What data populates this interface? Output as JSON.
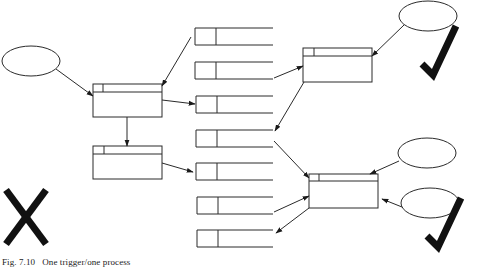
{
  "figure": {
    "caption": "Fig. 7.10   One trigger/one process",
    "colors": {
      "line": "#2a2a2a",
      "mark": "#111111",
      "background": "#ffffff"
    }
  },
  "diagram": {
    "triggers": [
      {
        "id": "trigger-left",
        "cx": 31,
        "cy": 61,
        "rx": 29,
        "ry": 15
      },
      {
        "id": "trigger-top-right",
        "cx": 428,
        "cy": 16,
        "rx": 29,
        "ry": 15
      },
      {
        "id": "trigger-right-upper",
        "cx": 427,
        "cy": 153,
        "rx": 29,
        "ry": 15
      },
      {
        "id": "trigger-right-lower",
        "cx": 430,
        "cy": 203,
        "rx": 29,
        "ry": 15
      }
    ],
    "processes": [
      {
        "id": "process-a",
        "x": 93,
        "y": 84,
        "w": 69,
        "h": 33,
        "header": 8,
        "tab": 10
      },
      {
        "id": "process-b",
        "x": 93,
        "y": 146,
        "w": 69,
        "h": 33,
        "header": 8,
        "tab": 11
      },
      {
        "id": "process-c",
        "x": 303,
        "y": 48,
        "w": 69,
        "h": 34,
        "header": 8,
        "tab": 11
      },
      {
        "id": "process-d",
        "x": 309,
        "y": 174,
        "w": 69,
        "h": 34,
        "header": 7,
        "tab": 10
      }
    ],
    "data_stores": [
      {
        "id": "store-1",
        "x": 195,
        "y": 28,
        "w": 78,
        "h": 17,
        "tab": 21
      },
      {
        "id": "store-2",
        "x": 195,
        "y": 62,
        "w": 78,
        "h": 17,
        "tab": 21
      },
      {
        "id": "store-3",
        "x": 196,
        "y": 96,
        "w": 77,
        "h": 17,
        "tab": 21
      },
      {
        "id": "store-4",
        "x": 196,
        "y": 130,
        "w": 77,
        "h": 17,
        "tab": 21
      },
      {
        "id": "store-5",
        "x": 196,
        "y": 163,
        "w": 77,
        "h": 17,
        "tab": 21
      },
      {
        "id": "store-6",
        "x": 197,
        "y": 197,
        "w": 76,
        "h": 17,
        "tab": 21
      },
      {
        "id": "store-7",
        "x": 197,
        "y": 230,
        "w": 76,
        "h": 17,
        "tab": 21
      }
    ],
    "arrows": [
      {
        "id": "trigger-left-to-process-a",
        "x1": 56,
        "y1": 69,
        "x2": 93,
        "y2": 96
      },
      {
        "id": "store-1-to-process-a",
        "x1": 191,
        "y1": 37,
        "x2": 162,
        "y2": 86
      },
      {
        "id": "process-a-to-store-3",
        "x1": 162,
        "y1": 100,
        "x2": 195,
        "y2": 104
      },
      {
        "id": "process-a-to-process-b",
        "x1": 127,
        "y1": 117,
        "x2": 127,
        "y2": 146
      },
      {
        "id": "process-b-to-store-5",
        "x1": 162,
        "y1": 163,
        "x2": 193,
        "y2": 172
      },
      {
        "id": "store-3-to-process-c",
        "x1": 274,
        "y1": 78,
        "x2": 303,
        "y2": 66
      },
      {
        "id": "trigger-top-right-to-process-c",
        "x1": 404,
        "y1": 25,
        "x2": 372,
        "y2": 56
      },
      {
        "id": "process-c-to-store-4",
        "x1": 304,
        "y1": 82,
        "x2": 275,
        "y2": 131
      },
      {
        "id": "store-4-to-process-d",
        "x1": 274,
        "y1": 141,
        "x2": 309,
        "y2": 178
      },
      {
        "id": "trigger-right-upper-to-process-d",
        "x1": 399,
        "y1": 161,
        "x2": 370,
        "y2": 174
      },
      {
        "id": "store-6-to-process-d",
        "x1": 274,
        "y1": 212,
        "x2": 309,
        "y2": 196
      },
      {
        "id": "trigger-right-lower-to-process-d",
        "x1": 402,
        "y1": 207,
        "x2": 382,
        "y2": 199
      },
      {
        "id": "process-d-to-store-7",
        "x1": 309,
        "y1": 208,
        "x2": 276,
        "y2": 233
      }
    ],
    "marks": {
      "check_top": {
        "label": "correct",
        "x": 442,
        "y": 78
      },
      "check_bottom": {
        "label": "correct",
        "x": 447,
        "y": 250
      },
      "cross": {
        "label": "incorrect",
        "x": 26,
        "y": 217
      }
    }
  }
}
